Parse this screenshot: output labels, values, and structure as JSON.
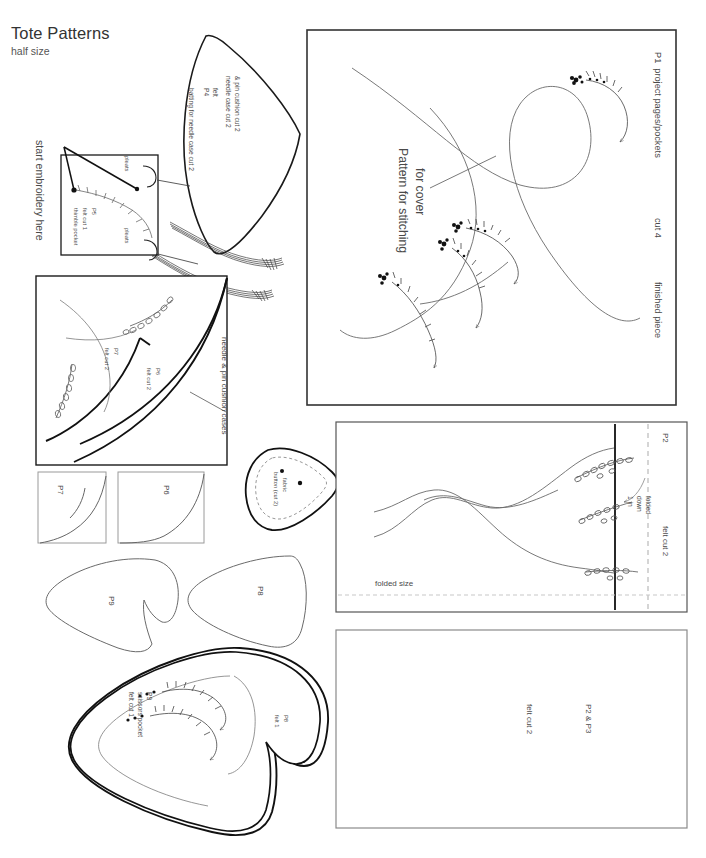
{
  "document": {
    "title": "Tote Patterns",
    "subtitle": "half size",
    "page_width": 706,
    "page_height": 858,
    "background_color": "#ffffff",
    "ink_color": "#4a4a4a",
    "line_color": "#222222"
  },
  "annotations": {
    "start_embroidery": "start embroidery here",
    "pleats_top": "pleats",
    "pleats_bottom": "pleats",
    "needle_pin_cushion_cases": "needle & pin cushion cases",
    "batting_note": "batting for needle case cut 2",
    "folded_size": "folded size",
    "folded_down_1in_a": "folded",
    "folded_down_1in_b": "down",
    "folded_down_1in_c": "1 in",
    "pattern_for_stitching_a": "Pattern for stitching",
    "pattern_for_stitching_b": "for cover",
    "finished_piece": "finished piece"
  },
  "pieces": {
    "p1": {
      "id": "P1",
      "name": "project pages/pockets",
      "cut": "cut 4",
      "heading": "P1  project pages/pockets"
    },
    "p2_top": {
      "id": "P2",
      "material": "felt cut 2"
    },
    "p2p3": {
      "id": "P2 & P3",
      "material": "felt cut 2"
    },
    "p4": {
      "id": "P4",
      "material": "felt",
      "cut_a": "needle case cut 2",
      "cut_b": "& pin cushion cut 2"
    },
    "p5": {
      "id": "P5",
      "material": "felt cut 1",
      "name": "thimble pocket"
    },
    "p6_case": {
      "id": "P6",
      "material": "felt cut 2"
    },
    "p7_case": {
      "id": "P7",
      "material": "felt cut 2"
    },
    "p7_small": {
      "id": "P7"
    },
    "p6_small": {
      "id": "P6"
    },
    "p8_small": {
      "id": "P8"
    },
    "p9_small": {
      "id": "P9"
    },
    "p8_large": {
      "id": "P8",
      "material": "felt 1"
    },
    "p9_large": {
      "id": "P9",
      "name": "scissors pocket",
      "material": "felt cut 1"
    },
    "button": {
      "name": "fabric",
      "cut": "button (cut 2)"
    }
  }
}
